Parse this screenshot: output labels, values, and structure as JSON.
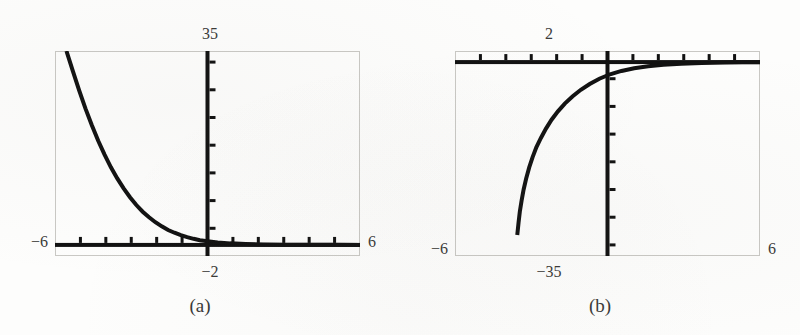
{
  "figure": {
    "background_color": "#fdfdfc",
    "ink_color": "#111111",
    "frame_color": "#c9c8c4"
  },
  "panels": [
    {
      "id": "a",
      "caption": "(a)",
      "labels": {
        "top": "35",
        "bottom": "−2",
        "left": "−6",
        "right": "6"
      }
    },
    {
      "id": "b",
      "caption": "(b)",
      "labels": {
        "top": "2",
        "bottom": "−35",
        "left": "−6",
        "right": "6"
      }
    }
  ],
  "chart_data": [
    {
      "type": "line",
      "title": "(a)",
      "xlabel": "",
      "ylabel": "",
      "xlim": [
        -6,
        6
      ],
      "ylim": [
        -2,
        35
      ],
      "grid": false,
      "legend": null,
      "axis_ticks": {
        "x": [
          -6,
          -5,
          -4,
          -3,
          -2,
          -1,
          0,
          1,
          2,
          3,
          4,
          5,
          6
        ],
        "y": [
          -2,
          3,
          8,
          13,
          18,
          23,
          28,
          33
        ]
      },
      "axis_tick_labels": {
        "x": [
          "−6",
          "",
          "",
          "",
          "",
          "",
          "",
          "",
          "",
          "",
          "",
          "",
          "6"
        ],
        "y": [
          "−2",
          "",
          "",
          "",
          "",
          "",
          "",
          "35"
        ]
      },
      "annotations": [
        {
          "text": "35",
          "position": "above-y-axis-top"
        },
        {
          "text": "−2",
          "position": "below-y-axis-bottom"
        },
        {
          "text": "−6",
          "position": "left-of-x-axis"
        },
        {
          "text": "6",
          "position": "right-of-x-axis"
        }
      ],
      "series": [
        {
          "name": "decaying exponential",
          "x": [
            -5.55,
            -5.3,
            -5.05,
            -4.8,
            -4.55,
            -4.3,
            -4.05,
            -3.8,
            -3.55,
            -3.3,
            -3.05,
            -2.8,
            -2.55,
            -2.3,
            -2.05,
            -1.8,
            -1.55,
            -1.3,
            -1.05,
            -0.8,
            -0.55,
            -0.3,
            0.0,
            0.4,
            0.9,
            1.5,
            2.2,
            3.0,
            4.0,
            5.0,
            6.0
          ],
          "y": [
            35.0,
            31.4,
            27.9,
            24.6,
            21.6,
            18.8,
            16.3,
            14.0,
            12.0,
            10.2,
            8.6,
            7.2,
            6.0,
            5.0,
            4.1,
            3.35,
            2.7,
            2.2,
            1.75,
            1.4,
            1.1,
            0.85,
            0.65,
            0.45,
            0.28,
            0.16,
            0.09,
            0.05,
            0.02,
            0.01,
            0.0
          ]
        }
      ]
    },
    {
      "type": "line",
      "title": "(b)",
      "xlabel": "",
      "ylabel": "",
      "xlim": [
        -6,
        6
      ],
      "ylim": [
        -35,
        2
      ],
      "grid": false,
      "legend": null,
      "axis_ticks": {
        "x": [
          -6,
          -5,
          -4,
          -3,
          -2,
          -1,
          0,
          1,
          2,
          3,
          4,
          5,
          6
        ],
        "y": [
          2,
          -3,
          -8,
          -13,
          -18,
          -23,
          -28,
          -33
        ]
      },
      "axis_tick_labels": {
        "x": [
          "−6",
          "",
          "",
          "",
          "",
          "",
          "",
          "",
          "",
          "",
          "",
          "",
          "6"
        ],
        "y": [
          "2",
          "",
          "",
          "",
          "",
          "",
          "",
          "−35"
        ]
      },
      "annotations": [
        {
          "text": "2",
          "position": "above-y-axis-top"
        },
        {
          "text": "−35",
          "position": "below-y-axis-bottom"
        },
        {
          "text": "−6",
          "position": "left-of-frame-bottom"
        },
        {
          "text": "6",
          "position": "right-of-frame-bottom"
        }
      ],
      "series": [
        {
          "name": "logarithmic rise",
          "x": [
            -3.55,
            -3.5,
            -3.45,
            -3.38,
            -3.3,
            -3.2,
            -3.08,
            -2.95,
            -2.8,
            -2.62,
            -2.42,
            -2.2,
            -1.95,
            -1.68,
            -1.38,
            -1.05,
            -0.7,
            -0.32,
            0.1,
            0.55,
            1.05,
            1.6,
            2.2,
            2.9,
            3.7,
            4.6,
            5.3,
            6.0
          ],
          "y": [
            -31.2,
            -29.0,
            -27.0,
            -25.0,
            -23.0,
            -21.0,
            -19.0,
            -17.2,
            -15.4,
            -13.7,
            -12.0,
            -10.4,
            -8.9,
            -7.5,
            -6.2,
            -5.0,
            -3.95,
            -3.0,
            -2.2,
            -1.6,
            -1.1,
            -0.75,
            -0.48,
            -0.3,
            -0.16,
            -0.08,
            -0.04,
            -0.02
          ]
        }
      ]
    }
  ]
}
